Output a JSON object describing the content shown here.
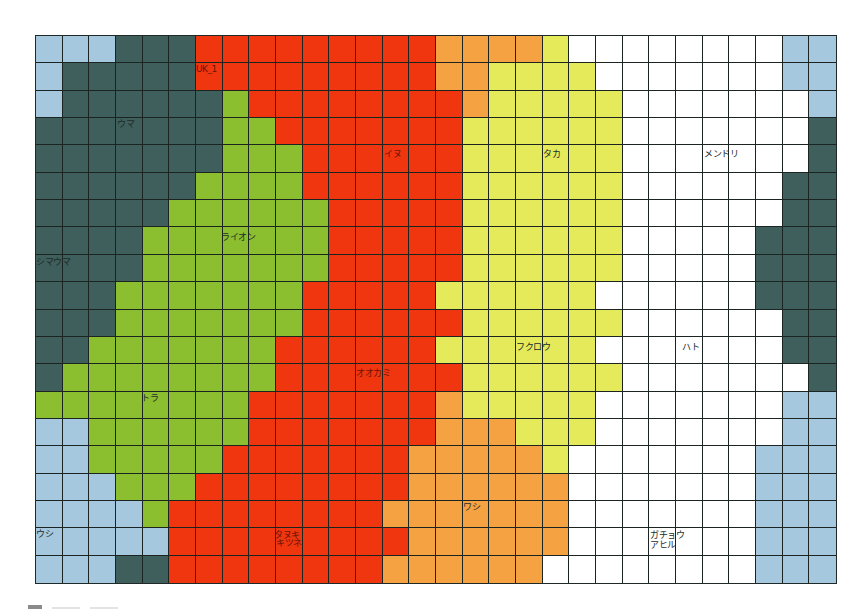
{
  "chart_data": {
    "type": "heatmap",
    "title": "",
    "grid": {
      "columns": 30,
      "rows": 20
    },
    "color_key": {
      "B": "#a6c8de",
      "D": "#3f5f5c",
      "G": "#8cbf2f",
      "R": "#f0360f",
      "O": "#f5a243",
      "Y": "#e4ea5a",
      "W": "#ffffff"
    },
    "cells": [
      "BBBDDDRRRRRRRRROOOOYWWWWWWWWBB",
      "BDDDDDRRRRRRRRROOYYYYWWWWWWWBB",
      "BDDDDDDGRRRRRRRROYYYYYWWWWWWWB",
      "DDDDDDDGGRRRRRRRYYYYYYWWWWWWWD",
      "DDDDDDDGGGRRRRRRYYYYYYWWWWWWWD",
      "DDDDDDGGGGRRRRRRYYYYYYWWWWWWDD",
      "DDDDDGGGGGGRRRRRYYYYYYWWWWWWDD",
      "DDDDGGGGGGGRRRRRYYYYYYWWWWWDDD",
      "DDDDGGGGGGGRRRRRYYYYYYWWWWWDDD",
      "DDDGGGGGGGRRRRRYYYYYYWWWWWWDDD",
      "DDDGGGGGGGRRRRRRYYYYYYWWWWWWDD",
      "DDGGGGGGGRRRRRRYYYYYYWWWWWWWDD",
      "DGGGGGGGGRRRRRRRYYYYYYWWWWWWWD",
      "GGGGGGGGRRRRRRROYYYYYWWWWWWWBB",
      "BBGGGGGGRRRRRRROOOYYYWWWWWWWBB",
      "BBGGGGGRRRRRRROOOOOYWWWWWWWBBB",
      "BBBGGGRRRRRRRROOOOOOWWWWWWWBBB",
      "BBBBGRRRRRRRROOOOOOOWWWWWWWBBB",
      "BBBBBRRRRRRRRROOOOOOWWWWWWWBBB",
      "BBBDDRRRRRRRROOOOOOWWWWWWWWBBB"
    ],
    "labels": [
      {
        "text": "UK_1",
        "x": 160,
        "y": 28,
        "tone": "red"
      },
      {
        "text": "ウマ",
        "x": 81,
        "y": 83,
        "tone": "dark"
      },
      {
        "text": "イヌ",
        "x": 348,
        "y": 113,
        "tone": "red"
      },
      {
        "text": "タカ",
        "x": 507,
        "y": 113,
        "tone": "dark"
      },
      {
        "text": "メンドリ",
        "x": 668,
        "y": 113,
        "tone": "dark"
      },
      {
        "text": "ライオン",
        "x": 185,
        "y": 196,
        "tone": "dark"
      },
      {
        "text": "シマウマ",
        "x": 0,
        "y": 221,
        "tone": "dark"
      },
      {
        "text": "フクロウ",
        "x": 480,
        "y": 306,
        "tone": "dark"
      },
      {
        "text": "ハト",
        "x": 646,
        "y": 306,
        "tone": "dark"
      },
      {
        "text": "オオカミ",
        "x": 320,
        "y": 332,
        "tone": "red"
      },
      {
        "text": "トラ",
        "x": 105,
        "y": 357,
        "tone": "dark"
      },
      {
        "text": "ワシ",
        "x": 427,
        "y": 466,
        "tone": "dark"
      },
      {
        "text": "ウシ",
        "x": 0,
        "y": 493,
        "tone": "dark"
      },
      {
        "text": "タヌキ",
        "x": 238,
        "y": 494,
        "tone": "red"
      },
      {
        "text": "キツネ",
        "x": 240,
        "y": 502,
        "tone": "red"
      },
      {
        "text": "ガチョウ",
        "x": 614,
        "y": 494,
        "tone": "dark"
      },
      {
        "text": "アヒル",
        "x": 614,
        "y": 504,
        "tone": "dark"
      }
    ],
    "xlabel": "",
    "ylabel": "",
    "legend": "partially visible at bottom (cut off)"
  }
}
